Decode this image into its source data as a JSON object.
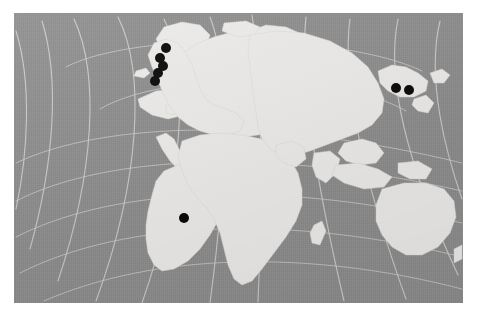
{
  "figure": {
    "type": "distribution-map",
    "title": "",
    "caption": "",
    "projection": "oblique azimuthal / polar-centred world map",
    "alt": "Grey world map with near-white landmasses and pale graticule curves; eight black filled circles mark localities in northern Scandinavia, the Japan / Russian Far East region and West Africa."
  },
  "colors": {
    "page_background": "#ffffff",
    "ocean": "#8e8e8e",
    "land": "#edecea",
    "coastline": "#d9d8d5",
    "graticule": "#d5d4d1",
    "point_marker": "#0a0a0a"
  },
  "plate": {
    "left": 14,
    "top": 13,
    "width": 449,
    "height": 290
  },
  "legend": {
    "visible": false,
    "entries": []
  },
  "axes": {
    "visible": false,
    "tick_labels": []
  },
  "chart_data": {
    "type": "scatter",
    "title": "",
    "subtitle": "",
    "xlabel": "",
    "ylabel": "",
    "grid": true,
    "legend_position": "none",
    "marker": {
      "shape": "circle",
      "fill": "#0a0a0a",
      "radius_px": 5.0
    },
    "coordinate_space": "plate pixels (449 x 290), origin top-left of grey map plate",
    "xlim": [
      0,
      449
    ],
    "ylim": [
      0,
      290
    ],
    "series": [
      {
        "name": "locality records",
        "count": 8,
        "points": [
          {
            "id": "p1",
            "region": "Northern Scandinavia",
            "x": 152,
            "y": 35
          },
          {
            "id": "p2",
            "region": "Northern Scandinavia",
            "x": 146,
            "y": 45
          },
          {
            "id": "p3",
            "region": "Northern Scandinavia",
            "x": 149,
            "y": 53
          },
          {
            "id": "p4",
            "region": "Northern Fennoscandia",
            "x": 144,
            "y": 60
          },
          {
            "id": "p5",
            "region": "Northern Fennoscandia",
            "x": 141,
            "y": 68
          },
          {
            "id": "p6",
            "region": "Japan / Russian Far East",
            "x": 382,
            "y": 75
          },
          {
            "id": "p7",
            "region": "Japan / Russian Far East",
            "x": 395,
            "y": 77
          },
          {
            "id": "p8",
            "region": "West Africa",
            "x": 170,
            "y": 205
          }
        ]
      }
    ],
    "graticule_curves": 14,
    "annotations": [
      {
        "name": "arctic-circle",
        "kind": "circle",
        "cx": 236,
        "cy": 64,
        "rx": 40,
        "ry": 31
      }
    ]
  },
  "map_geometry": {
    "landmasses": [
      {
        "name": "greenland"
      },
      {
        "name": "north-america"
      },
      {
        "name": "south-america"
      },
      {
        "name": "europe-scandinavia"
      },
      {
        "name": "africa"
      },
      {
        "name": "asia"
      },
      {
        "name": "japan-kamchatka"
      },
      {
        "name": "southeast-asia-islands"
      },
      {
        "name": "australia"
      },
      {
        "name": "new-zealand"
      },
      {
        "name": "madagascar"
      },
      {
        "name": "iceland"
      },
      {
        "name": "british-isles"
      }
    ]
  }
}
